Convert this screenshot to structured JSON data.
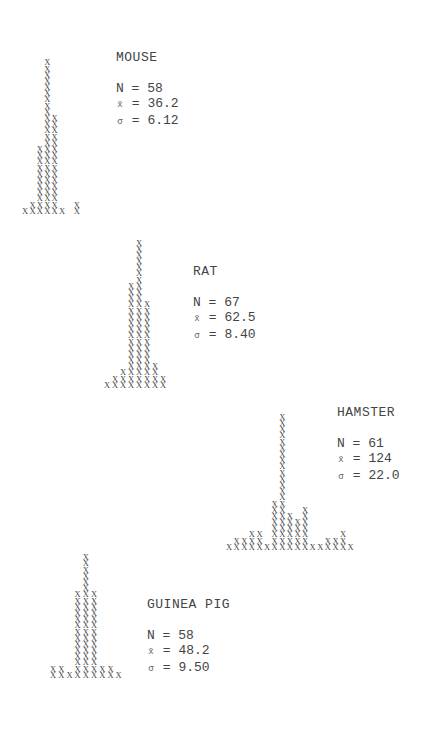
{
  "chart_data": [
    {
      "type": "bar",
      "style": "text-histogram (stacked X marks)",
      "title": "MOUSE",
      "stats": {
        "N": "58",
        "mean": "36.2",
        "sigma": "6.12"
      },
      "values": [
        1,
        2,
        11,
        25,
        16,
        1,
        0,
        2
      ],
      "values_note": "Column heights estimated from counted X marks; approximate"
    },
    {
      "type": "bar",
      "style": "text-histogram (stacked X marks)",
      "title": "RAT",
      "stats": {
        "N": "67",
        "mean": "62.5",
        "sigma": "8.40"
      },
      "values": [
        1,
        2,
        3,
        17,
        24,
        14,
        4,
        2
      ],
      "values_note": "Column heights estimated; adjusted so total matches printed N"
    },
    {
      "type": "bar",
      "style": "text-histogram (stacked X marks)",
      "title": "HAMSTER",
      "stats": {
        "N": "61",
        "mean": "124",
        "sigma": "22.0"
      },
      "values": [
        1,
        2,
        2,
        3,
        3,
        1,
        8,
        22,
        6,
        5,
        7,
        1,
        1,
        2,
        2,
        3,
        1
      ],
      "values_note": "Column heights estimated; approximate"
    },
    {
      "type": "bar",
      "style": "text-histogram (stacked X marks)",
      "title": "GUINEA PIG",
      "stats": {
        "N": "58",
        "mean": "48.2",
        "sigma": "9.50"
      },
      "values": [
        2,
        2,
        1,
        14,
        20,
        14,
        2,
        2,
        1
      ],
      "values_note": "Column heights estimated; adjusted so total matches printed N"
    }
  ],
  "labels": {
    "n_label": "N",
    "mean_symbol": "x̄",
    "sigma_symbol": "σ",
    "equals": "="
  },
  "layout": {
    "hists": [
      {
        "left": 22,
        "bottom_y": 214,
        "col_step": 7.4
      },
      {
        "left": 104,
        "bottom_y": 388,
        "col_step": 8.0
      },
      {
        "left": 226,
        "bottom_y": 550,
        "col_step": 7.6
      },
      {
        "left": 50,
        "bottom_y": 678,
        "col_step": 8.2
      }
    ],
    "stats_pos": [
      {
        "left": 116,
        "top": 50
      },
      {
        "left": 193,
        "top": 264
      },
      {
        "left": 337,
        "top": 405
      },
      {
        "left": 147,
        "top": 597
      }
    ]
  }
}
